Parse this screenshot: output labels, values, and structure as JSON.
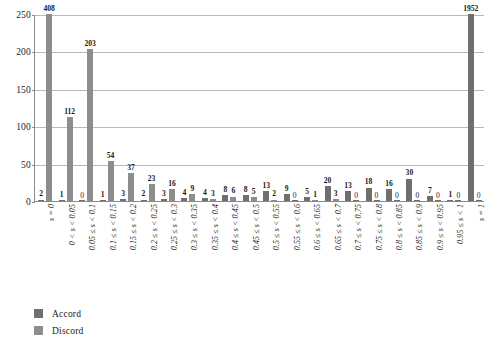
{
  "chart_data": {
    "type": "bar",
    "title": "",
    "subtitle": "",
    "xlabel": "",
    "ylabel": "",
    "ylim": [
      0,
      250
    ],
    "yticks": [
      0,
      50,
      100,
      150,
      200,
      250
    ],
    "grid": true,
    "legend_position": "bottom-left",
    "grouping": "grouped",
    "note": "Bars exceeding the y-axis maximum (250) are clipped at the top; their true values are shown as data labels (408, 1952).",
    "categories": [
      "s = 0",
      "0 < s < 0.05",
      "0.05 ≤ s < 0.1",
      "0.1 ≤ s < 0.15",
      "0.15 ≤ s < 0.2",
      "0.2 ≤ s < 0.25",
      "0.25 ≤ s < 0.3",
      "0.3 ≤ s < 0.35",
      "0.35 ≤ s < 0.4",
      "0.4 ≤ s < 0.45",
      "0.45 ≤ s < 0.5",
      "0.5 ≤ s < 0.55",
      "0.55 ≤ s < 0.6",
      "0.6 ≤ s < 0.65",
      "0.65 ≤ s < 0.7",
      "0.7 ≤ s < 0.75",
      "0.75 ≤ s < 0.8",
      "0.8 ≤ s < 0.85",
      "0.85 ≤ s < 0.9",
      "0.9 ≤ s < 0.95",
      "0.95 ≤ s < 1",
      "s = 1"
    ],
    "series": [
      {
        "name": "Accord",
        "color": "#6f6f6f",
        "values": [
          2,
          1,
          0,
          1,
          3,
          2,
          3,
          4,
          4,
          8,
          8,
          13,
          9,
          5,
          20,
          13,
          18,
          16,
          30,
          7,
          1,
          1952
        ]
      },
      {
        "name": "Discord",
        "color": "#8d8d8d",
        "values": [
          408,
          112,
          203,
          54,
          37,
          23,
          16,
          9,
          3,
          6,
          5,
          2,
          0,
          1,
          3,
          0,
          0,
          0,
          0,
          0,
          0,
          0
        ]
      }
    ]
  },
  "legend": {
    "items": [
      {
        "label": "Accord",
        "color": "#6f6f6f"
      },
      {
        "label": "Discord",
        "color": "#8d8d8d"
      }
    ]
  },
  "axis": {
    "y_tick_labels": [
      "0",
      "50",
      "100",
      "150",
      "200",
      "250"
    ]
  }
}
